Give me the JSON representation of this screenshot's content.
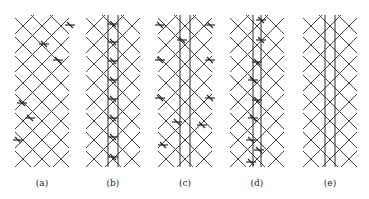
{
  "figure": {
    "panels": [
      {
        "id": "a",
        "label": "(a)",
        "cx": 42,
        "verticals": [],
        "marks": [
          [
            70,
            25
          ],
          [
            44,
            44
          ],
          [
            58,
            60
          ],
          [
            22,
            103
          ],
          [
            30,
            118
          ],
          [
            18,
            140
          ]
        ]
      },
      {
        "id": "b",
        "label": "(b)",
        "cx": 113,
        "verticals": [
          -5,
          5
        ],
        "marks": [
          [
            0,
            24
          ],
          [
            0,
            42
          ],
          [
            0,
            61
          ],
          [
            0,
            80
          ],
          [
            0,
            99
          ],
          [
            0,
            118
          ],
          [
            0,
            137
          ],
          [
            0,
            157
          ]
        ]
      },
      {
        "id": "c",
        "label": "(c)",
        "cx": 185,
        "verticals": [
          -5,
          5
        ],
        "marks": [
          [
            -25,
            25
          ],
          [
            25,
            25
          ],
          [
            -3,
            40
          ],
          [
            -25,
            60
          ],
          [
            25,
            60
          ],
          [
            -25,
            98
          ],
          [
            25,
            98
          ],
          [
            -8,
            122
          ],
          [
            17,
            125
          ],
          [
            -22,
            145
          ]
        ]
      },
      {
        "id": "d",
        "label": "(d)",
        "cx": 257,
        "verticals": [
          -4,
          4
        ],
        "marks": [
          [
            4,
            20
          ],
          [
            4,
            40
          ],
          [
            0,
            62
          ],
          [
            -4,
            80
          ],
          [
            0,
            100
          ],
          [
            -4,
            118
          ],
          [
            -6,
            140
          ],
          [
            2,
            150
          ],
          [
            -6,
            162
          ]
        ]
      },
      {
        "id": "e",
        "label": "(e)",
        "cx": 330,
        "verticals": [
          -5,
          5
        ],
        "marks": []
      }
    ],
    "lattice": {
      "top": 15,
      "bottom": 167,
      "half_width": 27,
      "spacing": 19
    },
    "line_color": "#2a2a2a"
  }
}
